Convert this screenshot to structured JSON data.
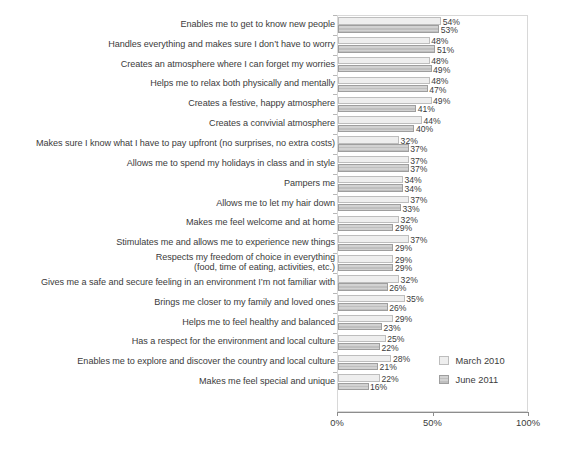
{
  "chart_data": {
    "type": "bar",
    "orientation": "horizontal",
    "title": "",
    "subtitle": "",
    "xlabel": "",
    "ylabel": "",
    "xlim": [
      0,
      100
    ],
    "xticks": [
      "0%",
      "50%",
      "100%"
    ],
    "xtick_values": [
      0,
      50,
      100
    ],
    "grid": false,
    "legend_position": "middle-right",
    "value_label_suffix": "%",
    "categories": [
      "Enables me to get to know new people",
      "Handles everything and makes sure I don’t have to worry",
      "Creates an atmosphere where I can forget my worries",
      "Helps me to relax both physically and mentally",
      "Creates a festive, happy atmosphere",
      "Creates a convivial atmosphere",
      "Makes sure I know what I have to pay upfront (no surprises, no extra costs)",
      "Allows me to spend my holidays in class and in style",
      "Pampers me",
      "Allows me to let my hair down",
      "Makes me feel welcome and at home",
      "Stimulates me and allows me to experience new things",
      "Respects my freedom of choice in everything\n(food, time of eating, activities, etc.)",
      "Gives me a safe and secure feeling in an environment I’m not familiar with",
      "Brings me closer to my family and loved ones",
      "Helps me to feel healthy and balanced",
      "Has a respect for the environment and local culture",
      "Enables me to explore and discover the country and local culture",
      "Makes me feel special and unique"
    ],
    "series": [
      {
        "name": "March 2010",
        "color": "#eeeeee",
        "values": [
          54,
          48,
          48,
          48,
          49,
          44,
          32,
          37,
          34,
          37,
          32,
          37,
          29,
          32,
          35,
          29,
          25,
          28,
          22
        ],
        "value_labels": [
          "54%",
          "48%",
          "48%",
          "48%",
          "49%",
          "44%",
          "32%",
          "37%",
          "34%",
          "37%",
          "32%",
          "37%",
          "29%",
          "32%",
          "35%",
          "29%",
          "25%",
          "28%",
          "22%"
        ]
      },
      {
        "name": "June 2011",
        "color": "#c6c6c6",
        "values": [
          53,
          51,
          49,
          47,
          41,
          40,
          37,
          37,
          34,
          33,
          29,
          29,
          29,
          26,
          26,
          23,
          22,
          21,
          16
        ],
        "value_labels": [
          "53%",
          "51%",
          "49%",
          "47%",
          "41%",
          "40%",
          "37%",
          "37%",
          "34%",
          "33%",
          "29%",
          "29%",
          "29%",
          "26%",
          "26%",
          "23%",
          "22%",
          "21%",
          "16%"
        ]
      }
    ]
  },
  "legend": {
    "items": [
      {
        "label": "March 2010"
      },
      {
        "label": "June 2011"
      }
    ]
  },
  "axis": {
    "x_tick_labels": [
      "0%",
      "50%",
      "100%"
    ]
  }
}
